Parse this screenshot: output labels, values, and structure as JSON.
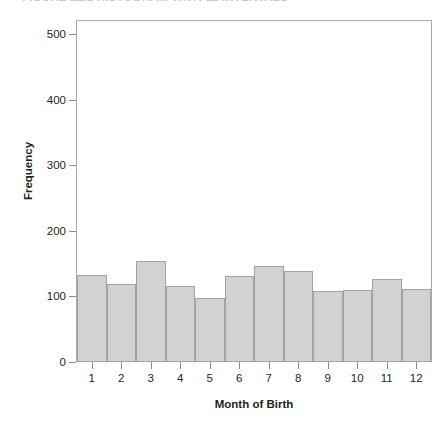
{
  "caption": {
    "text": "FIGURE 12.1  HISTOGRAM WITH 12 INTERVALS"
  },
  "chart_data": {
    "type": "bar",
    "title": "",
    "subtitle": "",
    "xlabel": "Month of Birth",
    "ylabel": "Frequency",
    "categories": [
      "1",
      "2",
      "3",
      "4",
      "5",
      "6",
      "7",
      "8",
      "9",
      "10",
      "11",
      "12"
    ],
    "values": [
      133,
      119,
      154,
      116,
      98,
      131,
      146,
      139,
      108,
      110,
      126,
      111
    ],
    "ylim": [
      0,
      520
    ],
    "yticks": [
      0,
      100,
      200,
      300,
      400,
      500
    ],
    "ytick_labels": [
      "0",
      "100",
      "200",
      "300",
      "400",
      "500"
    ],
    "xtick_labels": [
      "1",
      "2",
      "3",
      "4",
      "5",
      "6",
      "7",
      "8",
      "9",
      "10",
      "11",
      "12"
    ],
    "grid": false,
    "legend": null,
    "bar_fill_color": "#d2d2d2",
    "bar_edge_color": "#a3a3a3",
    "frame_color": "#a9a9a9",
    "text_color": "#231f20"
  }
}
